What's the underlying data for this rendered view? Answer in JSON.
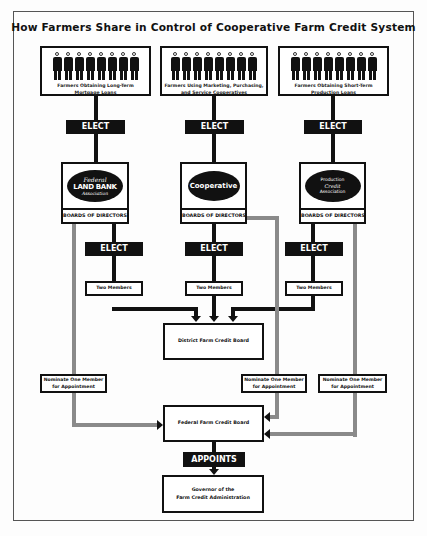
{
  "title": "How Farmers Share in Control of Cooperative Farm Credit System",
  "columns": [
    {
      "farmers_label_line1": "Farmers Obtaining Long-Term",
      "farmers_label_line2": "Mortgage Loans",
      "elect_label": "ELECT",
      "logo_lines": [
        "Federal",
        "LAND BANK",
        "Association"
      ],
      "boards_label": "BOARDS OF DIRECTORS",
      "elect2_label": "ELECT",
      "members_label": "Two Members",
      "nominate_line1": "Nominate One Member",
      "nominate_line2": "for Appointment"
    },
    {
      "farmers_label_line1": "Farmers Using Marketing, Purchasing,",
      "farmers_label_line2": "and Service Cooperatives",
      "elect_label": "ELECT",
      "logo_lines": [
        "Cooperative"
      ],
      "boards_label": "BOARDS OF DIRECTORS",
      "elect2_label": "ELECT",
      "members_label": "Two Members",
      "nominate_line1": "Nominate One Member",
      "nominate_line2": "for Appointment"
    },
    {
      "farmers_label_line1": "Farmers Obtaining Short-Term",
      "farmers_label_line2": "Production Loans",
      "elect_label": "ELECT",
      "logo_lines": [
        "Production",
        "Credit",
        "Association"
      ],
      "boards_label": "BOARDS OF DIRECTORS",
      "elect2_label": "ELECT",
      "members_label": "Two Members",
      "nominate_line1": "Nominate One Member",
      "nominate_line2": "for Appointment"
    }
  ],
  "district_board": "District Farm Credit Board",
  "federal_board": "Federal Farm Credit Board",
  "appoints_label": "APPOINTS",
  "governor_line1": "Governor of the",
  "governor_line2": "Farm Credit Administration",
  "colors": {
    "ink": "#111111",
    "gray_line": "#8a8a8a",
    "paper": "#fdfdfd"
  }
}
